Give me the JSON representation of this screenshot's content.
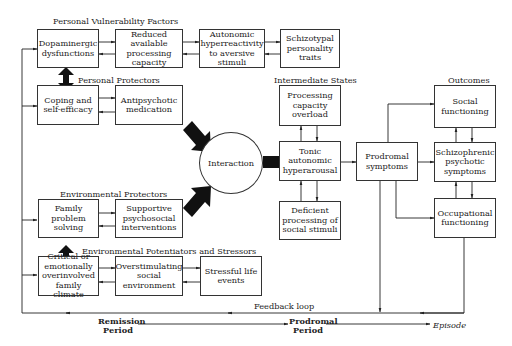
{
  "sections": {
    "personal_vulnerability": "Personal Vulnerability Factors",
    "personal_protectors": "Personal Protectors",
    "environmental_protectors": "Environmental Protectors",
    "environmental_stressors": "Environmental Potentiators and Stressors",
    "intermediate_states": "Intermediate States",
    "outcomes": "Outcomes"
  },
  "boxes": {
    "dopaminergic": "Dopaminergic dysfunctions",
    "reduced_capacity": "Reduced available processing capacity",
    "autonomic_hyper": "Autonomic hyperreactivity to aversive stimuli",
    "schizotypal": "Schizotypal personality traits",
    "coping": "Coping and self-efficacy",
    "antipsychotic": "Antipsychotic medication",
    "family_problem": "Family problem solving",
    "supportive": "Supportive psychosocial interventions",
    "critical_climate": "Critical or emotionally overinvolved family climate",
    "overstimulating": "Overstimulating social environment",
    "stressful": "Stressful life events",
    "processing_overload": "Processing capacity overload",
    "tonic": "Tonic autonomic hyperarousal",
    "deficient": "Deficient processing of social stimuli",
    "prodromal": "Prodromal symptoms",
    "social_functioning": "Social functioning",
    "schizophrenic": "Schizophrenic psychotic symptoms",
    "occupational": "Occupational functioning"
  },
  "interaction": "Interaction",
  "feedback_loop": "Feedback loop",
  "timeline": {
    "remission": "Remission Period",
    "prodromal": "Prodromal Period",
    "episode": "Episode"
  }
}
